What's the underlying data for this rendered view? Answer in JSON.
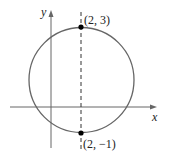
{
  "diagram": {
    "type": "circle-on-axes",
    "axes": {
      "x_label": "x",
      "y_label": "y"
    },
    "points": [
      {
        "label": "(2, 3)",
        "x": 2,
        "y": 3
      },
      {
        "label": "(2, −1)",
        "x": 2,
        "y": -1
      }
    ],
    "dashed_line": {
      "x": 2
    },
    "colors": {
      "circle": "#555555",
      "axes": "#555555",
      "points": "#000000"
    }
  }
}
